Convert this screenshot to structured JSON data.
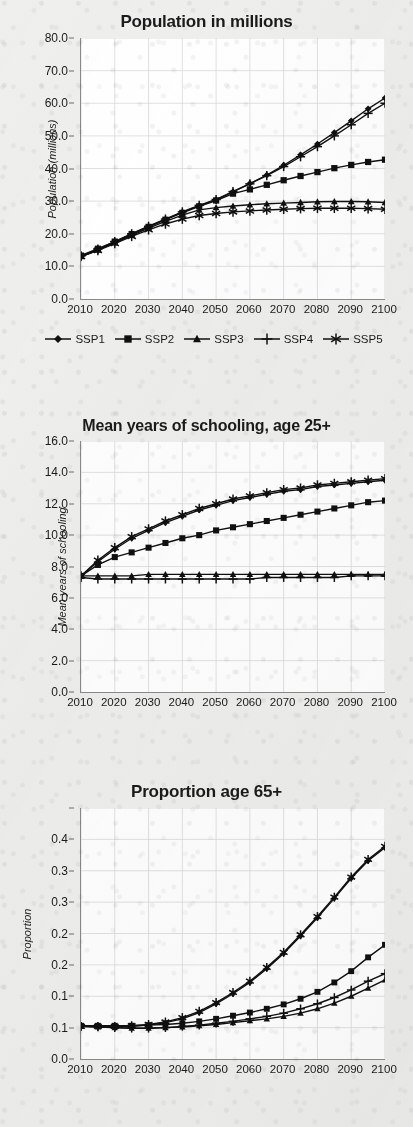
{
  "page": {
    "background_color": "#efefed",
    "plot_background_color": "#ffffff",
    "series_color": "#101010",
    "gridline_color": "#d9d9d9",
    "axis_color": "#8a8a8a"
  },
  "legend": {
    "position": "below-first-chart",
    "items": [
      {
        "label": "SSP1",
        "marker": "diamond"
      },
      {
        "label": "SSP2",
        "marker": "square"
      },
      {
        "label": "SSP3",
        "marker": "triangle"
      },
      {
        "label": "SSP4",
        "marker": "plus"
      },
      {
        "label": "SSP5",
        "marker": "asterisk"
      }
    ]
  },
  "chart_data": [
    {
      "id": "population",
      "type": "line",
      "title": "Population in millions",
      "xlabel": "",
      "ylabel": "Population (millions)",
      "x": [
        2010,
        2015,
        2020,
        2025,
        2030,
        2035,
        2040,
        2045,
        2050,
        2055,
        2060,
        2065,
        2070,
        2075,
        2080,
        2085,
        2090,
        2095,
        2100
      ],
      "xlim": [
        2010,
        2100
      ],
      "ylim": [
        0.0,
        80.0
      ],
      "xticks": [
        2010,
        2020,
        2030,
        2040,
        2050,
        2060,
        2070,
        2080,
        2090,
        2100
      ],
      "xtick_labels": [
        "2010",
        "2020",
        "2030",
        "2040",
        "2050",
        "2060",
        "2070",
        "2080",
        "2090",
        "2100"
      ],
      "yticks": [
        0.0,
        10.0,
        20.0,
        30.0,
        40.0,
        50.0,
        60.0,
        70.0,
        80.0
      ],
      "ytick_labels": [
        "0.0",
        "10.0",
        "20.0",
        "30.0",
        "40.0",
        "50.0",
        "60.0",
        "70.0",
        "80.0"
      ],
      "grid": true,
      "series": [
        {
          "name": "SSP1",
          "marker": "diamond",
          "values": [
            13.0,
            15.0,
            17.4,
            19.9,
            22.2,
            24.4,
            26.6,
            28.6,
            30.4,
            32.9,
            35.4,
            38.0,
            41.0,
            44.2,
            47.5,
            51.0,
            54.6,
            58.3,
            61.6
          ]
        },
        {
          "name": "SSP2",
          "marker": "square",
          "values": [
            13.3,
            15.4,
            17.6,
            19.9,
            22.1,
            24.3,
            26.4,
            28.4,
            30.2,
            32.3,
            33.6,
            35.0,
            36.4,
            37.7,
            38.9,
            40.1,
            41.1,
            42.0,
            42.7
          ]
        },
        {
          "name": "SSP3",
          "marker": "triangle",
          "values": [
            13.0,
            15.0,
            17.2,
            19.5,
            21.7,
            23.8,
            25.7,
            27.3,
            28.0,
            28.5,
            28.9,
            29.2,
            29.4,
            29.6,
            29.8,
            29.9,
            29.9,
            29.8,
            29.6
          ]
        },
        {
          "name": "SSP4",
          "marker": "plus",
          "values": [
            13.2,
            15.3,
            17.6,
            20.0,
            22.3,
            24.5,
            26.7,
            28.7,
            30.5,
            32.9,
            35.3,
            37.8,
            40.6,
            43.6,
            46.7,
            50.0,
            53.4,
            56.9,
            60.0
          ]
        },
        {
          "name": "SSP5",
          "marker": "asterisk",
          "values": [
            13.0,
            14.9,
            17.0,
            19.2,
            21.2,
            23.0,
            24.5,
            25.6,
            26.2,
            26.7,
            27.0,
            27.3,
            27.5,
            27.7,
            27.8,
            27.8,
            27.8,
            27.7,
            27.5
          ]
        }
      ]
    },
    {
      "id": "schooling",
      "type": "line",
      "title": "Mean years of schooling, age 25+",
      "xlabel": "",
      "ylabel": "Mean years of schooling",
      "x": [
        2010,
        2015,
        2020,
        2025,
        2030,
        2035,
        2040,
        2045,
        2050,
        2055,
        2060,
        2065,
        2070,
        2075,
        2080,
        2085,
        2090,
        2095,
        2100
      ],
      "xlim": [
        2010,
        2100
      ],
      "ylim": [
        0.0,
        16.0
      ],
      "xticks": [
        2010,
        2020,
        2030,
        2040,
        2050,
        2060,
        2070,
        2080,
        2090,
        2100
      ],
      "xtick_labels": [
        "2010",
        "2020",
        "2030",
        "2040",
        "2050",
        "2060",
        "2070",
        "2080",
        "2090",
        "2100"
      ],
      "yticks": [
        0.0,
        2.0,
        4.0,
        6.0,
        8.0,
        10.0,
        12.0,
        14.0,
        16.0
      ],
      "ytick_labels": [
        "0.0",
        "2.0",
        "4.0",
        "6.0",
        "8.0",
        "10.0",
        "12.0",
        "14.0",
        "16.0"
      ],
      "grid": true,
      "series": [
        {
          "name": "SSP1",
          "marker": "diamond",
          "values": [
            7.4,
            8.3,
            9.1,
            9.8,
            10.3,
            10.8,
            11.2,
            11.6,
            11.9,
            12.2,
            12.4,
            12.6,
            12.8,
            12.9,
            13.1,
            13.2,
            13.3,
            13.4,
            13.5
          ]
        },
        {
          "name": "SSP2",
          "marker": "square",
          "values": [
            7.4,
            8.1,
            8.6,
            8.9,
            9.2,
            9.5,
            9.8,
            10.0,
            10.3,
            10.5,
            10.7,
            10.9,
            11.1,
            11.3,
            11.5,
            11.7,
            11.9,
            12.1,
            12.2
          ]
        },
        {
          "name": "SSP3",
          "marker": "triangle",
          "values": [
            7.4,
            7.4,
            7.4,
            7.4,
            7.5,
            7.5,
            7.5,
            7.5,
            7.5,
            7.5,
            7.5,
            7.5,
            7.5,
            7.5,
            7.5,
            7.5,
            7.5,
            7.5,
            7.5
          ]
        },
        {
          "name": "SSP4",
          "marker": "plus",
          "values": [
            7.3,
            7.2,
            7.2,
            7.2,
            7.2,
            7.2,
            7.2,
            7.2,
            7.2,
            7.2,
            7.2,
            7.3,
            7.3,
            7.3,
            7.3,
            7.3,
            7.4,
            7.4,
            7.4
          ]
        },
        {
          "name": "SSP5",
          "marker": "asterisk",
          "values": [
            7.4,
            8.4,
            9.2,
            9.9,
            10.4,
            10.9,
            11.3,
            11.7,
            12.0,
            12.3,
            12.5,
            12.7,
            12.9,
            13.0,
            13.2,
            13.3,
            13.4,
            13.5,
            13.6
          ]
        }
      ]
    },
    {
      "id": "proportion",
      "type": "line",
      "title": "Proportion age 65+",
      "xlabel": "",
      "ylabel": "Proportion",
      "x": [
        2010,
        2015,
        2020,
        2025,
        2030,
        2035,
        2040,
        2045,
        2050,
        2055,
        2060,
        2065,
        2070,
        2075,
        2080,
        2085,
        2090,
        2095,
        2100
      ],
      "xlim": [
        2010,
        2100
      ],
      "ylim": [
        0.0,
        0.4
      ],
      "xticks": [
        2010,
        2020,
        2030,
        2040,
        2050,
        2060,
        2070,
        2080,
        2090,
        2100
      ],
      "xtick_labels": [
        "2010",
        "2020",
        "2030",
        "2040",
        "2050",
        "2060",
        "2070",
        "2080",
        "2090",
        "2100"
      ],
      "yticks": [
        0.0,
        0.05,
        0.1,
        0.15,
        0.2,
        0.25,
        0.3,
        0.35,
        0.4
      ],
      "ytick_labels": [
        "0.0",
        "0.1",
        "0.1",
        "0.2",
        "0.2",
        "0.3",
        "0.3",
        "0.4"
      ],
      "grid": true,
      "series": [
        {
          "name": "SSP1",
          "marker": "diamond",
          "values": [
            0.052,
            0.052,
            0.052,
            0.052,
            0.054,
            0.058,
            0.064,
            0.074,
            0.088,
            0.104,
            0.122,
            0.144,
            0.168,
            0.196,
            0.225,
            0.256,
            0.288,
            0.316,
            0.337
          ]
        },
        {
          "name": "SSP2",
          "marker": "square",
          "values": [
            0.053,
            0.053,
            0.053,
            0.053,
            0.054,
            0.055,
            0.057,
            0.06,
            0.064,
            0.069,
            0.074,
            0.08,
            0.087,
            0.096,
            0.107,
            0.122,
            0.14,
            0.162,
            0.182
          ]
        },
        {
          "name": "SSP3",
          "marker": "triangle",
          "values": [
            0.052,
            0.051,
            0.05,
            0.049,
            0.049,
            0.05,
            0.051,
            0.053,
            0.055,
            0.058,
            0.061,
            0.064,
            0.068,
            0.073,
            0.08,
            0.089,
            0.1,
            0.113,
            0.126
          ]
        },
        {
          "name": "SSP4",
          "marker": "plus",
          "values": [
            0.052,
            0.051,
            0.05,
            0.049,
            0.049,
            0.05,
            0.052,
            0.054,
            0.057,
            0.06,
            0.064,
            0.068,
            0.073,
            0.08,
            0.088,
            0.098,
            0.11,
            0.124,
            0.136
          ]
        },
        {
          "name": "SSP5",
          "marker": "asterisk",
          "values": [
            0.052,
            0.052,
            0.052,
            0.053,
            0.055,
            0.059,
            0.066,
            0.076,
            0.09,
            0.106,
            0.124,
            0.146,
            0.17,
            0.198,
            0.227,
            0.258,
            0.29,
            0.318,
            0.339
          ]
        }
      ]
    }
  ]
}
